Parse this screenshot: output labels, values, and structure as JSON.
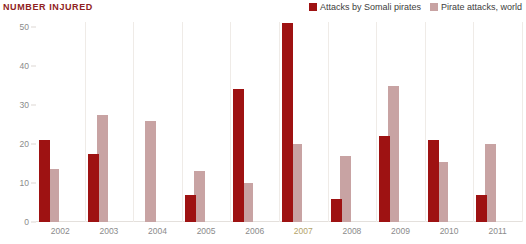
{
  "title": "NUMBER INJURED",
  "legend": {
    "position": "top-right",
    "entries": [
      {
        "label": "Attacks by Somali pirates",
        "color": "#9e1212"
      },
      {
        "label": "Pirate attacks, world",
        "color": "#c8a3a3"
      }
    ]
  },
  "axes": {
    "y_ticks": [
      "0",
      "10",
      "20",
      "30",
      "40",
      "50"
    ],
    "x_ticks": [
      "2002",
      "2003",
      "2004",
      "2005",
      "2006",
      "2007",
      "2008",
      "2009",
      "2010",
      "2011"
    ],
    "x_highlight_tick": "2007",
    "x_highlight_color": "#b3a36a",
    "tick_label_color": "#8b8b8b",
    "grid": false
  },
  "colors": {
    "title": "#8f2222",
    "series_a": "#9e1212",
    "series_b": "#c8a3a3",
    "separator": "#efebe7",
    "baseline": "#e4e0dc",
    "background": "#ffffff"
  },
  "chart_data": {
    "type": "bar",
    "title": "NUMBER INJURED",
    "xlabel": "",
    "ylabel": "",
    "ylim": [
      0,
      50
    ],
    "ytick_step": 10,
    "grid": false,
    "legend_position": "top-right",
    "categories": [
      "2002",
      "2003",
      "2004",
      "2005",
      "2006",
      "2007",
      "2008",
      "2009",
      "2010",
      "2011"
    ],
    "series": [
      {
        "name": "Attacks by Somali pirates",
        "color": "#9e1212",
        "values": [
          21,
          17.5,
          0,
          7,
          34,
          51,
          6,
          22,
          21,
          7
        ]
      },
      {
        "name": "Pirate attacks, world",
        "color": "#c8a3a3",
        "values": [
          13.5,
          27.5,
          26,
          13,
          10,
          20,
          17,
          35,
          15.5,
          20
        ]
      }
    ]
  }
}
